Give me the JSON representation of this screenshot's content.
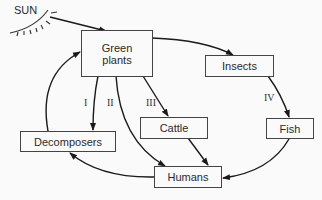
{
  "diagram": {
    "sun_label": "SUN",
    "nodes": {
      "green_plants": {
        "line1": "Green",
        "line2": "plants"
      },
      "insects": "Insects",
      "cattle": "Cattle",
      "fish": "Fish",
      "decomposers": "Decomposers",
      "humans": "Humans"
    },
    "pathways": {
      "i": "I",
      "ii": "II",
      "iii": "III",
      "iv": "IV"
    },
    "edges": [
      {
        "from": "SUN",
        "to": "Green plants"
      },
      {
        "from": "Green plants",
        "to": "Insects"
      },
      {
        "from": "Green plants",
        "to": "Decomposers",
        "label": "I"
      },
      {
        "from": "Green plants",
        "to": "Humans",
        "label": "II"
      },
      {
        "from": "Green plants",
        "to": "Cattle",
        "label": "III"
      },
      {
        "from": "Insects",
        "to": "Fish",
        "label": "IV"
      },
      {
        "from": "Cattle",
        "to": "Humans"
      },
      {
        "from": "Fish",
        "to": "Humans"
      },
      {
        "from": "Humans",
        "to": "Decomposers"
      },
      {
        "from": "Decomposers",
        "to": "Green plants"
      }
    ],
    "colors": {
      "line": "#1a1a1a",
      "box_border": "#444444",
      "background": "#fafafa"
    }
  }
}
